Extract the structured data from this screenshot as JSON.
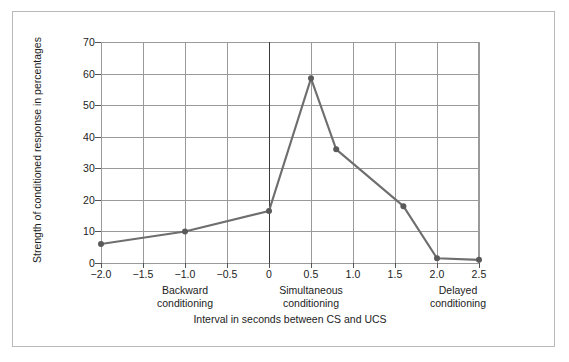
{
  "chart_data": {
    "type": "line",
    "title": "",
    "subtitle": "",
    "xlabel": "Interval in seconds between CS and UCS",
    "ylabel": "Strength of conditioned response in percentages",
    "xlim": [
      -2.0,
      2.5
    ],
    "ylim": [
      0,
      70
    ],
    "grid": true,
    "legend": null,
    "x_ticks": [
      "−2.0",
      "−1.5",
      "−1.0",
      "−0.5",
      "0",
      "0.5",
      "1.0",
      "1.5",
      "2.0",
      "2.5"
    ],
    "x_tick_values": [
      -2.0,
      -1.5,
      -1.0,
      -0.5,
      0,
      0.5,
      1.0,
      1.5,
      2.0,
      2.5
    ],
    "y_ticks": [
      "0",
      "10",
      "20",
      "30",
      "40",
      "50",
      "60",
      "70"
    ],
    "y_tick_values": [
      0,
      10,
      20,
      30,
      40,
      50,
      60,
      70
    ],
    "x": [
      -2.0,
      -1.0,
      0.0,
      0.5,
      0.8,
      1.6,
      2.0,
      2.5
    ],
    "values": [
      6,
      10,
      16.5,
      58.5,
      36,
      18,
      1.5,
      1
    ],
    "series": [
      {
        "name": "Strength of conditioned response",
        "x": [
          -2.0,
          -1.0,
          0.0,
          0.5,
          0.8,
          1.6,
          2.0,
          2.5
        ],
        "values": [
          6,
          10,
          16.5,
          58.5,
          36,
          18,
          1.5,
          1
        ],
        "color": "#6e6e6e",
        "marker": "circle",
        "marker_color": "#5a5a5a"
      }
    ],
    "annotations": [
      {
        "text_line1": "Backward",
        "text_line2": "conditioning",
        "x": -1.0
      },
      {
        "text_line1": "Simultaneous",
        "text_line2": "conditioning",
        "x": 0.5
      },
      {
        "text_line1": "Delayed",
        "text_line2": "conditioning",
        "x": 2.25
      }
    ],
    "reference_line": {
      "x": 0,
      "color": "#3a3a3a",
      "emphasis": "bold"
    },
    "colors": {
      "line": "#6e6e6e",
      "marker": "#5a5a5a",
      "grid": "#9a9a9a",
      "zero_line": "#3a3a3a",
      "frame": "#b9b9b9",
      "text": "#1c1c1c",
      "background": "#ffffff"
    }
  }
}
